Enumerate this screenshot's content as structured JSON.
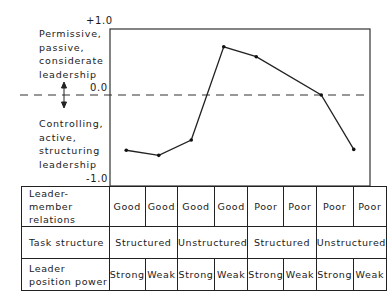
{
  "chart_data": {
    "type": "line",
    "title": "",
    "xlabel": "",
    "ylabel": "",
    "ylim": [
      -1.0,
      1.0
    ],
    "y_ticks": [
      "+1.0",
      "0.0",
      "-1.0"
    ],
    "upper_label": "Permissive, passive, considerate leadership",
    "lower_label": "Controlling, active, structuring leadership",
    "reference_line": {
      "y": 0.0,
      "style": "dashed"
    },
    "categories": [
      "I",
      "II",
      "III",
      "IV",
      "V",
      "VI",
      "VII",
      "VIII"
    ],
    "series": [
      {
        "name": "Leadership style",
        "values": [
          -0.65,
          -0.71,
          -0.53,
          0.73,
          0.58,
          null,
          0.0,
          -0.64
        ]
      }
    ],
    "grid": false,
    "legend": null
  },
  "axis": {
    "top_label": "+1.0",
    "zero_label": "0.0",
    "bottom_label": "-1.0",
    "upper_text": [
      "Permissive,",
      "passive,",
      "considerate",
      "leadership"
    ],
    "lower_text": [
      "Controlling,",
      "active,",
      "structuring",
      "leadership"
    ]
  },
  "table": {
    "rows": [
      {
        "header": "Leader-member relations",
        "cells": [
          "Good",
          "Good",
          "Good",
          "Good",
          "Poor",
          "Poor",
          "Poor",
          "Poor"
        ]
      },
      {
        "header": "Task structure",
        "cells": [
          "Structured",
          "Unstructured",
          "Structured",
          "Unstructured"
        ]
      },
      {
        "header": "Leader position power",
        "cells": [
          "Strong",
          "Weak",
          "Strong",
          "Weak",
          "Strong",
          "Weak",
          "Strong",
          "Weak"
        ]
      }
    ]
  }
}
